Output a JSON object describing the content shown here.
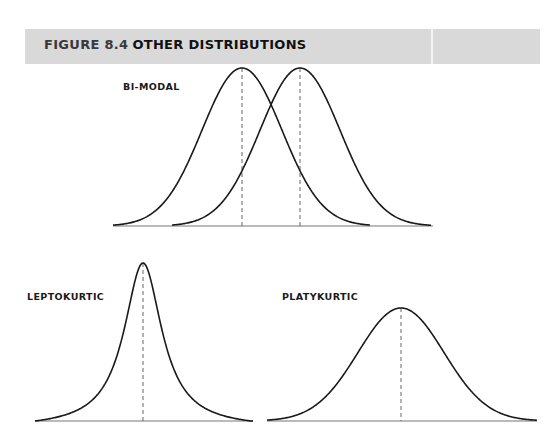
{
  "header": {
    "figure_number": "FIGURE 8.4",
    "title": "OTHER DISTRIBUTIONS",
    "background_color": "#d9d9d9"
  },
  "panels": {
    "bimodal": {
      "label": "BI-MODAL"
    },
    "leptokurtic": {
      "label": "LEPTOKURTIC"
    },
    "platykurtic": {
      "label": "PLATYKURTIC"
    }
  },
  "colors": {
    "curve": "#1a1a1a",
    "baseline": "#777777",
    "mean_line": "#666666"
  },
  "chart_data": [
    {
      "type": "line",
      "title": "BI-MODAL",
      "series": [
        {
          "name": "distribution-1",
          "shape": "normal",
          "mean_px": 242,
          "sigma_px": 40,
          "peak_height_px": 158
        },
        {
          "name": "distribution-2",
          "shape": "normal",
          "mean_px": 300,
          "sigma_px": 40,
          "peak_height_px": 158
        }
      ],
      "baseline_y_px": 226,
      "x_range_px": [
        113,
        433
      ],
      "mean_markers": "dashed vertical lines at each peak"
    },
    {
      "type": "line",
      "title": "LEPTOKURTIC",
      "series": [
        {
          "name": "leptokurtic",
          "shape": "heavy-tailed, sharply peaked",
          "mean_px": 143,
          "gamma_px": 23,
          "peak_height_px": 158
        }
      ],
      "baseline_y_px": 421,
      "x_range_px": [
        35,
        253
      ],
      "mean_markers": "dashed vertical line at peak"
    },
    {
      "type": "line",
      "title": "PLATYKURTIC",
      "series": [
        {
          "name": "platykurtic",
          "shape": "flat, broad",
          "mean_px": 401,
          "sigma_px": 43,
          "peak_height_px": 113
        }
      ],
      "baseline_y_px": 421,
      "x_range_px": [
        267,
        537
      ],
      "mean_markers": "dashed vertical line at peak"
    }
  ]
}
